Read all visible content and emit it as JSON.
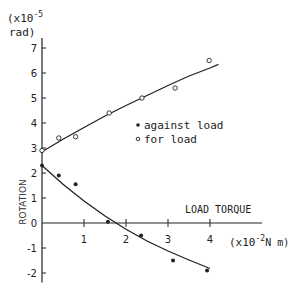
{
  "chart_data": {
    "type": "scatter",
    "title": "",
    "xlabel": "LOAD TORQUE",
    "xunit": "(x10^-2 N m)",
    "xunit_parts": {
      "pre": "(x10",
      "exp": "-2",
      "post": "N m)"
    },
    "ylabel": "ROTATION",
    "yunit_parts": {
      "pre": "(x10",
      "exp": "-5",
      "post": "rad)"
    },
    "xlim": [
      0,
      5
    ],
    "ylim": [
      -2.3,
      7.4
    ],
    "x_ticks": [
      1,
      2,
      3,
      4
    ],
    "x_tick_labels": [
      "1",
      "2",
      "3",
      "4"
    ],
    "y_ticks": [
      -2,
      -1,
      0,
      1,
      2,
      3,
      4,
      5,
      6,
      7
    ],
    "y_tick_labels": [
      "-2",
      "-1",
      "0",
      "1",
      "2",
      "3",
      "4",
      "5",
      "6",
      "7"
    ],
    "grid": false,
    "legend_position": "center",
    "series": [
      {
        "name": "against load",
        "marker": "filled-circle",
        "points": [
          [
            0.0,
            2.3
          ],
          [
            0.4,
            1.9
          ],
          [
            0.8,
            1.55
          ],
          [
            1.57,
            0.05
          ],
          [
            2.36,
            -0.5
          ],
          [
            3.12,
            -1.5
          ],
          [
            3.93,
            -1.9
          ]
        ],
        "fit_curve": [
          [
            0.0,
            2.3
          ],
          [
            0.5,
            1.55
          ],
          [
            1.0,
            0.88
          ],
          [
            1.5,
            0.28
          ],
          [
            2.0,
            -0.25
          ],
          [
            2.5,
            -0.72
          ],
          [
            3.0,
            -1.12
          ],
          [
            3.5,
            -1.48
          ],
          [
            4.0,
            -1.82
          ]
        ]
      },
      {
        "name": "for load",
        "marker": "open-circle",
        "points": [
          [
            0.0,
            2.9
          ],
          [
            0.4,
            3.4
          ],
          [
            0.8,
            3.45
          ],
          [
            1.6,
            4.4
          ],
          [
            2.38,
            5.0
          ],
          [
            3.17,
            5.4
          ],
          [
            3.98,
            6.5
          ]
        ],
        "fit_curve": [
          [
            0.0,
            2.85
          ],
          [
            0.5,
            3.35
          ],
          [
            1.0,
            3.82
          ],
          [
            1.5,
            4.28
          ],
          [
            2.0,
            4.7
          ],
          [
            2.5,
            5.1
          ],
          [
            3.0,
            5.5
          ],
          [
            3.5,
            5.88
          ],
          [
            4.0,
            6.2
          ],
          [
            4.2,
            6.35
          ]
        ]
      }
    ]
  },
  "legend": {
    "items": [
      {
        "symbol": "•",
        "label": "against load"
      },
      {
        "symbol": "∘",
        "label": "for load"
      }
    ]
  },
  "colors": {
    "ink": "#222222",
    "background": "#ffffff"
  }
}
